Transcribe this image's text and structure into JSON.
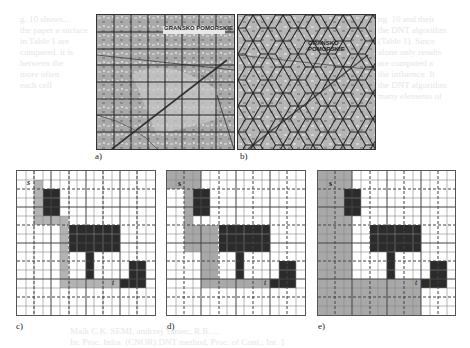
{
  "figure": {
    "ghost_text_right": [
      "ng. 10 and their",
      "the DNT algorithm",
      "(Table 1). Since",
      "alone only results",
      "are computed a",
      "the influence. It",
      "the DNT algorithm",
      "many elements of"
    ],
    "ghost_text_left": [
      "g. 10 shows...",
      "the paper a surface",
      "in Table 1 are",
      "compared.  it is",
      "between the",
      "more often",
      "each cell"
    ],
    "ghost_text_bottom": [
      "Maik C.K. SEMI, andrzej Yaniec, R.B. ...",
      "In: Proc. Infra. (CNOR) DNT method, Proc. of Conf., Int. 1"
    ],
    "map_label": "GRANSKO POMORSKIE",
    "panels": [
      {
        "id": "a",
        "caption": "a)",
        "type": "square-grid-map"
      },
      {
        "id": "b",
        "caption": "b)",
        "type": "hex-grid-map"
      },
      {
        "id": "c",
        "caption": "c)",
        "start": "s",
        "target": "t",
        "type": "path-grid"
      },
      {
        "id": "d",
        "caption": "d)",
        "start": "s",
        "target": "t",
        "type": "path-grid"
      },
      {
        "id": "e",
        "caption": "e)",
        "start": "s",
        "target": "t",
        "type": "path-grid"
      }
    ]
  }
}
